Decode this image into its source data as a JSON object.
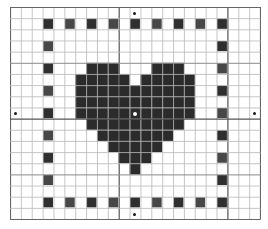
{
  "chart": {
    "columns": 23,
    "rows": 19,
    "origin": [
      10,
      7
    ],
    "cell_width": 10.87,
    "cell_height": 11.16,
    "major_lines": {
      "vertical_after_col": [
        10,
        20
      ],
      "horizontal_after_row": [
        10
      ]
    },
    "medium_lines": {
      "horizontal_after_row": [
        5,
        15
      ]
    },
    "colors": {
      "background": "#ffffff",
      "grid_line": "#b8b8b8",
      "major_line": "#555555",
      "border_line": "#666666",
      "stitch_dark": "#2f2f2f",
      "stitch_alt": "#474747",
      "heart_fill": "#2b2b2b",
      "marker": "#1a1a1a",
      "center_marker": "#ffffff"
    }
  },
  "border_stitches": {
    "top_row": 2,
    "bottom_row": 18,
    "left_col": 4,
    "right_col": 20,
    "cols": [
      4,
      6,
      8,
      10,
      12,
      14,
      16,
      18,
      20
    ],
    "rows": [
      2,
      4,
      6,
      8,
      10,
      12,
      14,
      16,
      18
    ]
  },
  "heart": {
    "rows": [
      {
        "row": 6,
        "cols": [
          8,
          9,
          10,
          14,
          15,
          16
        ]
      },
      {
        "row": 7,
        "cols": [
          7,
          8,
          9,
          10,
          11,
          13,
          14,
          15,
          16,
          17
        ]
      },
      {
        "row": 8,
        "cols": [
          7,
          8,
          9,
          10,
          11,
          12,
          13,
          14,
          15,
          16,
          17
        ]
      },
      {
        "row": 9,
        "cols": [
          7,
          8,
          9,
          10,
          11,
          12,
          13,
          14,
          15,
          16,
          17
        ]
      },
      {
        "row": 10,
        "cols": [
          7,
          8,
          9,
          10,
          11,
          12,
          13,
          14,
          15,
          16,
          17
        ]
      },
      {
        "row": 11,
        "cols": [
          8,
          9,
          10,
          11,
          12,
          13,
          14,
          15,
          16
        ]
      },
      {
        "row": 12,
        "cols": [
          9,
          10,
          11,
          12,
          13,
          14,
          15
        ]
      },
      {
        "row": 13,
        "cols": [
          10,
          11,
          12,
          13,
          14
        ]
      },
      {
        "row": 14,
        "cols": [
          11,
          12,
          13
        ]
      },
      {
        "row": 15,
        "cols": [
          12
        ]
      }
    ]
  },
  "markers": [
    {
      "name": "top-center-marker",
      "x": 134,
      "y": 13
    },
    {
      "name": "bottom-center-marker",
      "x": 134,
      "y": 214
    },
    {
      "name": "left-center-marker",
      "x": 15,
      "y": 113
    },
    {
      "name": "right-center-marker",
      "x": 254,
      "y": 113
    },
    {
      "name": "center-marker",
      "x": 134,
      "y": 113,
      "center": true
    }
  ]
}
